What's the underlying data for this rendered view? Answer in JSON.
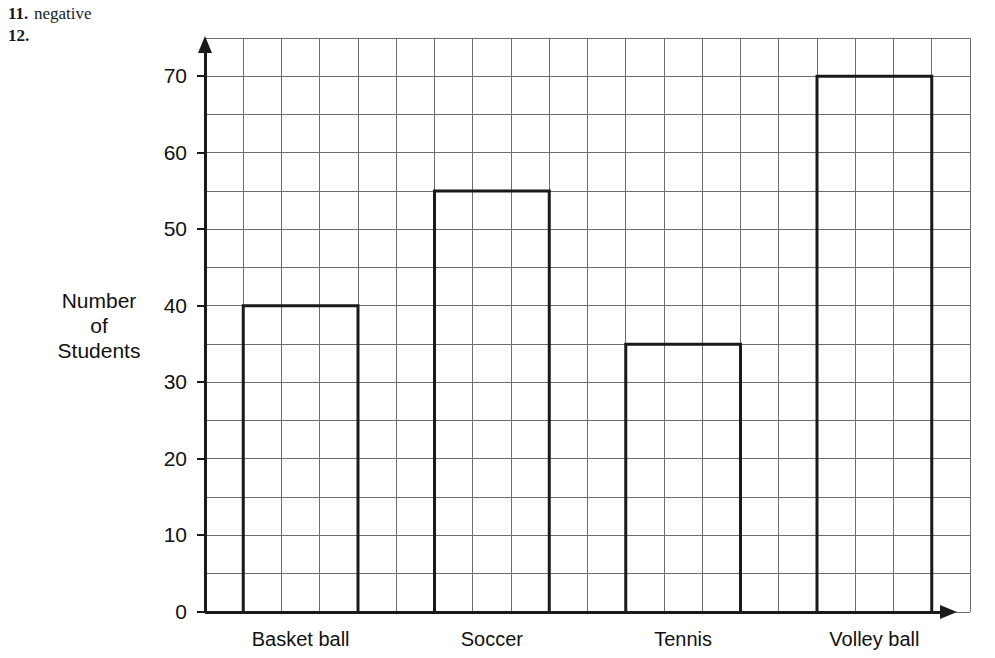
{
  "worksheet": {
    "items": [
      {
        "number": "11.",
        "answer": "negative"
      },
      {
        "number": "12.",
        "answer": ""
      }
    ]
  },
  "chart_data": {
    "type": "bar",
    "title": "",
    "xlabel": "",
    "ylabel": "Number of Students",
    "ylabel_lines": [
      "Number",
      "of",
      "Students"
    ],
    "categories": [
      "Basket ball",
      "Soccer",
      "Tennis",
      "Volley ball"
    ],
    "values": [
      40,
      55,
      35,
      70
    ],
    "ylim": [
      0,
      75
    ],
    "yticks": [
      0,
      10,
      20,
      30,
      40,
      50,
      60,
      70
    ],
    "ytick_labels": [
      "0",
      "10",
      "20",
      "30",
      "40",
      "50",
      "60",
      "70"
    ],
    "grid": true,
    "grid_minor_step": 5,
    "grid_columns": 20,
    "legend": null,
    "bar_style": {
      "fill": "#ffffff",
      "stroke": "#1a1a1a",
      "stroke_width": 3
    },
    "axis_color": "#1a1a1a",
    "grid_color": "#6e6e6e"
  }
}
